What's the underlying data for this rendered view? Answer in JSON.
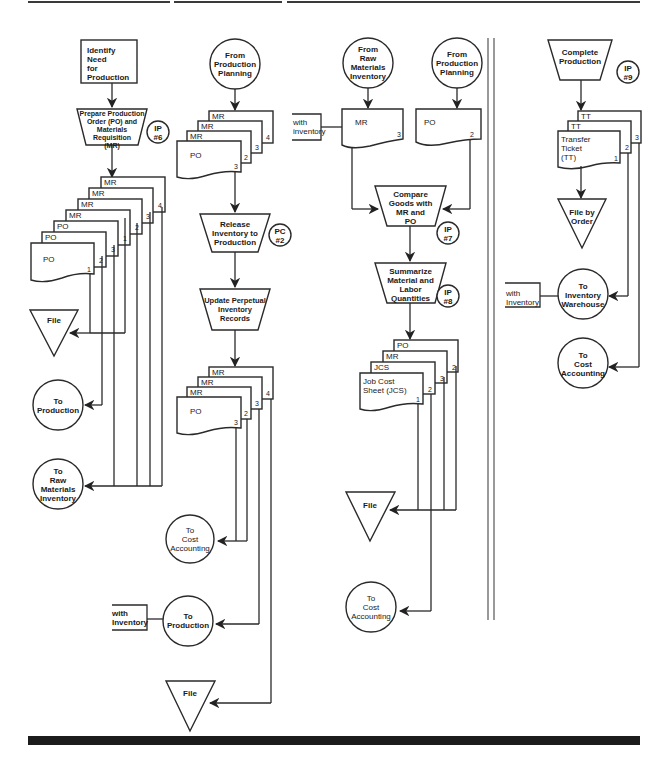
{
  "columns": [
    {
      "id": "production-planning",
      "start": "Identify\nNeed\nfor Production",
      "process1": {
        "label": "Prepare Production\nOrder (PO) and\nMaterials\nRequisition\n(MR)",
        "ref": "IP\n#6"
      },
      "documents": [
        {
          "tag": "MR",
          "copy": "4"
        },
        {
          "tag": "MR",
          "copy": "3"
        },
        {
          "tag": "MR",
          "copy": "2"
        },
        {
          "tag": "MR",
          "copy": "1"
        },
        {
          "tag": "PO",
          "copy": "3"
        },
        {
          "tag": "PO",
          "copy": "2"
        },
        {
          "tag": "PO",
          "copy": "1"
        }
      ],
      "file": "File",
      "outputs": [
        "To\nProduction",
        "To\nRaw\nMaterials\nInventory"
      ]
    },
    {
      "id": "raw-materials-inventory",
      "start": "From\nProduction\nPlanning",
      "documents": [
        {
          "tag": "MR",
          "copy": "4"
        },
        {
          "tag": "MR",
          "copy": "3"
        },
        {
          "tag": "MR",
          "copy": "2"
        },
        {
          "tag": "PO",
          "copy": "3"
        }
      ],
      "process1": {
        "label": "Release\nInventory to\nProduction",
        "ref": "PC\n#2"
      },
      "process2": {
        "label": "Update Perpetual\nInventory\nRecords"
      },
      "documents_out": [
        {
          "tag": "MR",
          "copy": "4"
        },
        {
          "tag": "MR",
          "copy": "3"
        },
        {
          "tag": "MR",
          "copy": "2"
        },
        {
          "tag": "PO",
          "copy": "3"
        }
      ],
      "outputs": [
        "To\nCost\nAccounting",
        "To\nProduction"
      ],
      "with_inventory": "with\nInventory",
      "file": "File"
    },
    {
      "id": "production",
      "start_left": "From\nRaw\nMaterials\nInventory",
      "start_right": "From\nProduction\nPlanning",
      "with_inventory": "with\ninventory",
      "doc_left": {
        "tag": "MR",
        "copy": "3"
      },
      "doc_right": {
        "tag": "PO",
        "copy": "2"
      },
      "process1": {
        "label": "Compare\nGoods with\nMR and\nPO",
        "ref": "IP\n#7"
      },
      "process2": {
        "label": "Summarize\nMaterial and\nLabor\nQuantities",
        "ref": "IP\n#8"
      },
      "documents": [
        {
          "tag": "PO",
          "copy": "2"
        },
        {
          "tag": "MR",
          "copy": "3"
        },
        {
          "tag": "JCS",
          "copy": "2"
        },
        {
          "tag": "Job Cost\nSheet (JCS)",
          "copy": "1"
        }
      ],
      "file": "File",
      "output": "To\nCost\nAccounting"
    },
    {
      "id": "production-complete",
      "process1": {
        "label": "Complete\nProduction",
        "ref": "IP\n#9"
      },
      "documents": [
        {
          "tag": "TT",
          "copy": "3"
        },
        {
          "tag": "TT",
          "copy": "2"
        },
        {
          "tag": "Transfer\nTicket\n(TT)",
          "copy": "1"
        }
      ],
      "file": "File by\nOrder",
      "with_inventory": "with\nInventory",
      "outputs": [
        "To\nInventory\nWarehouse",
        "To\nCost\nAccounting"
      ]
    }
  ]
}
